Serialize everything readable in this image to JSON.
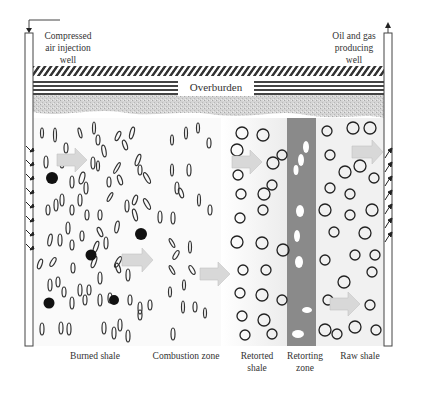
{
  "diagram": {
    "wells": {
      "injection": {
        "label_lines": [
          "Compressed",
          "air injection",
          "well"
        ]
      },
      "production": {
        "label_lines": [
          "Oil and gas",
          "producing",
          "well"
        ]
      }
    },
    "overburden_label": "Overburden",
    "zones": [
      {
        "id": "burned",
        "label_lines": [
          "Burned shale"
        ]
      },
      {
        "id": "combustion",
        "label_lines": [
          "Combustion zone"
        ]
      },
      {
        "id": "retorted",
        "label_lines": [
          "Retorted",
          "shale"
        ]
      },
      {
        "id": "retorting",
        "label_lines": [
          "Retorting",
          "zone"
        ]
      },
      {
        "id": "raw",
        "label_lines": [
          "Raw shale"
        ]
      }
    ],
    "colors": {
      "retorting_band": "#8a8a8a",
      "arrow_fill": "#d8d8d8",
      "raw_shale_bg": "#f2f2f2",
      "rubble": "#c8c8c8",
      "line": "#444444"
    }
  }
}
